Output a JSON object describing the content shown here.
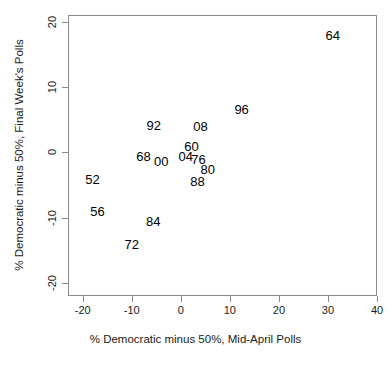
{
  "chart_data": {
    "type": "scatter",
    "title": "",
    "subtitle": "",
    "xlabel": "% Democratic minus 50%, Mid-April Polls",
    "ylabel": "% Democratic minus 50%, Final Week's Polls",
    "xlim": [
      -23,
      40
    ],
    "ylim": [
      -22,
      21
    ],
    "xticks": [
      -20,
      -10,
      0,
      10,
      20,
      30,
      40
    ],
    "yticks": [
      20,
      10,
      0,
      -10,
      -20
    ],
    "xticklabels": [
      "-20",
      "-10",
      "0",
      "10",
      "20",
      "30",
      "40"
    ],
    "yticklabels": [
      "20",
      "10",
      "0",
      "-10",
      "-20"
    ],
    "grid": false,
    "legend": null,
    "point_marker": "text-label",
    "points": [
      {
        "label": "64",
        "x": 31.0,
        "y": 18.0
      },
      {
        "label": "96",
        "x": 12.4,
        "y": 6.6
      },
      {
        "label": "08",
        "x": 4.0,
        "y": 4.0
      },
      {
        "label": "92",
        "x": -5.5,
        "y": 4.2
      },
      {
        "label": "60",
        "x": 2.2,
        "y": 0.9
      },
      {
        "label": "04",
        "x": 1.0,
        "y": -0.6
      },
      {
        "label": "76",
        "x": 3.6,
        "y": -1.1
      },
      {
        "label": "00",
        "x": -4.0,
        "y": -1.3
      },
      {
        "label": "68",
        "x": -7.6,
        "y": -0.6
      },
      {
        "label": "80",
        "x": 5.5,
        "y": -2.6
      },
      {
        "label": "88",
        "x": 3.4,
        "y": -4.4
      },
      {
        "label": "52",
        "x": -18.0,
        "y": -4.1
      },
      {
        "label": "56",
        "x": -17.0,
        "y": -9.0
      },
      {
        "label": "84",
        "x": -5.6,
        "y": -10.5
      },
      {
        "label": "72",
        "x": -10.0,
        "y": -14.1
      }
    ]
  },
  "axes": {
    "x_title": "% Democratic minus 50%, Mid-April Polls",
    "y_title": "% Democratic minus 50%, Final Week's Polls"
  }
}
